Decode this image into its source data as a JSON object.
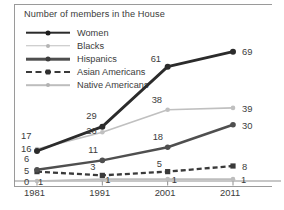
{
  "chart_data": {
    "type": "line",
    "title": "Number of members in the House",
    "xlabel": "",
    "ylabel": "",
    "categories": [
      "1981",
      "1991",
      "2001",
      "2011"
    ],
    "ylim": [
      0,
      72
    ],
    "grid": false,
    "legend_position": "top-left",
    "series": [
      {
        "name": "Women",
        "values": [
          16,
          29,
          61,
          69
        ],
        "color": "#2b2b2b",
        "style": "solid-thick"
      },
      {
        "name": "Blacks",
        "values": [
          17,
          26,
          38,
          39
        ],
        "color": "#c0c0c0",
        "style": "solid-light"
      },
      {
        "name": "Hispanics",
        "values": [
          6,
          11,
          18,
          30
        ],
        "color": "#4f4f4f",
        "style": "solid-medium"
      },
      {
        "name": "Asian Americans",
        "values": [
          5,
          3,
          5,
          8
        ],
        "color": "#3a3a3a",
        "style": "dashed"
      },
      {
        "name": "Native Americans",
        "values": [
          0,
          1,
          1,
          1
        ],
        "color": "#bdbdbd",
        "style": "solid-light"
      }
    ],
    "point_labels": [
      {
        "series": "Blacks",
        "category": "1981",
        "text": "17"
      },
      {
        "series": "Women",
        "category": "1981",
        "text": "16"
      },
      {
        "series": "Hispanics",
        "category": "1981",
        "text": "6"
      },
      {
        "series": "Asian Americans",
        "category": "1981",
        "text": "5"
      },
      {
        "series": "Native Americans",
        "category": "1981",
        "text": "0"
      },
      {
        "series": "Native Americans",
        "category": "1981",
        "text": "1"
      },
      {
        "series": "Women",
        "category": "1991",
        "text": "29"
      },
      {
        "series": "Blacks",
        "category": "1991",
        "text": "26"
      },
      {
        "series": "Hispanics",
        "category": "1991",
        "text": "11"
      },
      {
        "series": "Asian Americans",
        "category": "1991",
        "text": "3"
      },
      {
        "series": "Native Americans",
        "category": "1991",
        "text": "1"
      },
      {
        "series": "Women",
        "category": "2001",
        "text": "61"
      },
      {
        "series": "Blacks",
        "category": "2001",
        "text": "38"
      },
      {
        "series": "Hispanics",
        "category": "2001",
        "text": "18"
      },
      {
        "series": "Asian Americans",
        "category": "2001",
        "text": "5"
      },
      {
        "series": "Native Americans",
        "category": "2001",
        "text": "1"
      },
      {
        "series": "Women",
        "category": "2011",
        "text": "69"
      },
      {
        "series": "Blacks",
        "category": "2011",
        "text": "39"
      },
      {
        "series": "Hispanics",
        "category": "2011",
        "text": "30"
      },
      {
        "series": "Asian Americans",
        "category": "2011",
        "text": "8"
      },
      {
        "series": "Native Americans",
        "category": "2011",
        "text": "1"
      }
    ]
  }
}
